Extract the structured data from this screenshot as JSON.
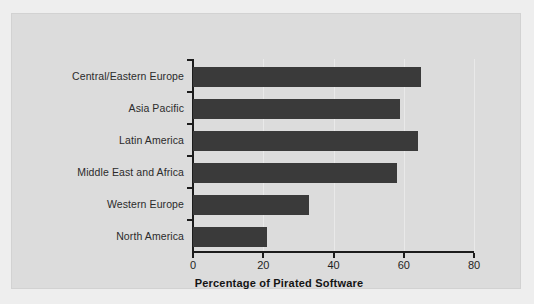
{
  "chart_data": {
    "type": "bar",
    "orientation": "horizontal",
    "title": "",
    "xlabel": "Percentage of Pirated Software",
    "ylabel": "",
    "categories": [
      "Central/Eastern Europe",
      "Asia Pacific",
      "Latin America",
      "Middle East and Africa",
      "Western Europe",
      "North America"
    ],
    "values": [
      65,
      59,
      64,
      58,
      33,
      21
    ],
    "xlim": [
      0,
      80
    ],
    "xticks": [
      0,
      20,
      40,
      60,
      80
    ],
    "xtick_labels": [
      "0",
      "20",
      "40",
      "60",
      "80"
    ],
    "grid": true,
    "grid_axis": "x",
    "legend": null,
    "bar_color": "#3a3a3a",
    "panel_color": "#dcdcdc",
    "page_color": "#eeeeee",
    "axis_color": "#1c1c1c"
  }
}
